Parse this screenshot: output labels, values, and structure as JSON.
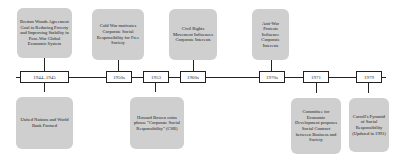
{
  "diagram": {
    "type": "timeline",
    "dates": [
      {
        "label": "1944–1945"
      },
      {
        "label": "1950s"
      },
      {
        "label": "1953"
      },
      {
        "label": "1960s"
      },
      {
        "label": "1970s"
      },
      {
        "label": "1971"
      },
      {
        "label": "1979"
      }
    ],
    "events_above": [
      {
        "date": "1944–1945",
        "text": "Bretton Woods Agreement Goal to Reducing Poverty and Improving Stability in Post–War Global Economic System"
      },
      {
        "date": "1950s",
        "text": "Cold War motivates Corporate Social Responsibility for Free Society"
      },
      {
        "date": "1960s",
        "text": "Civil Rights Movement Influences Corporate Interests"
      },
      {
        "date": "1970s",
        "text": "Anti-War Protests Influence Corporate Interests"
      }
    ],
    "events_below": [
      {
        "date": "1944–1945",
        "text": "United Nations and World Bank Formed"
      },
      {
        "date": "1953",
        "text": "Howard Bowen coins phrase \"Corporate Social Responsibility\" (CSR)"
      },
      {
        "date": "1971",
        "text": "Committee for Economic Development proposes Social Contract between Business and Society"
      },
      {
        "date": "1979",
        "text": "Carroll's Pyramid of Social Responsibility (Updated in 1991)"
      }
    ]
  }
}
